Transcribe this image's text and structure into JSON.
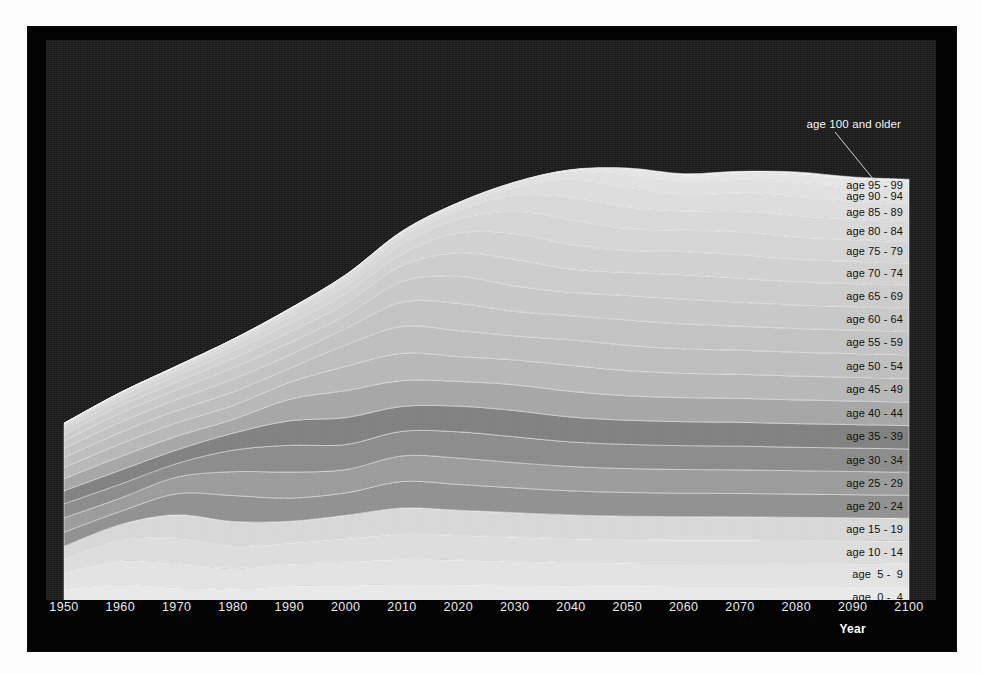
{
  "chart_data": {
    "type": "area",
    "title": "",
    "xlabel": "Year",
    "ylabel": "",
    "stacking": "stacked",
    "grid": false,
    "legend_position": "right-inline",
    "xlim": [
      1950,
      2100
    ],
    "x_ticks": [
      "1950",
      "1960",
      "1970",
      "1980",
      "1990",
      "2000",
      "2010",
      "2020",
      "2030",
      "2040",
      "2050",
      "2060",
      "2070",
      "2080",
      "2090",
      "2100"
    ],
    "x": [
      1950,
      1960,
      1970,
      1980,
      1990,
      2000,
      2010,
      2020,
      2030,
      2040,
      2050,
      2060,
      2070,
      2080,
      2090,
      2100
    ],
    "annotation": {
      "text": "age 100 and older",
      "points_to_series": "age 95 - 99"
    },
    "series": [
      {
        "name": "age  0 -  4",
        "color": "#e8e8e8",
        "values": [
          16.4,
          20.3,
          17.2,
          16.3,
          18.8,
          19.2,
          20.2,
          19.9,
          19.4,
          19.0,
          18.8,
          18.7,
          18.7,
          18.6,
          18.5,
          18.4
        ]
      },
      {
        "name": "age  5 -  9",
        "color": "#e2e2e2",
        "values": [
          13.2,
          18.7,
          19.9,
          16.8,
          18.0,
          19.3,
          20.4,
          20.1,
          19.6,
          19.1,
          18.9,
          18.8,
          18.8,
          18.7,
          18.6,
          18.5
        ]
      },
      {
        "name": "age 10 - 14",
        "color": "#dcdcdc",
        "values": [
          11.1,
          16.8,
          20.8,
          18.2,
          17.1,
          19.1,
          20.5,
          20.3,
          19.8,
          19.3,
          19.0,
          18.9,
          18.9,
          18.8,
          18.7,
          18.6
        ]
      },
      {
        "name": "age 15 - 19",
        "color": "#d7d7d7",
        "values": [
          10.6,
          13.2,
          19.1,
          20.3,
          17.8,
          19.0,
          21.5,
          20.5,
          20.0,
          19.5,
          19.2,
          19.1,
          19.0,
          18.9,
          18.8,
          18.7
        ]
      },
      {
        "name": "age 20 - 24",
        "color": "#8f8f8f",
        "values": [
          11.5,
          10.8,
          17.2,
          21.2,
          19.0,
          18.4,
          21.6,
          21.1,
          20.3,
          19.7,
          19.4,
          19.2,
          19.1,
          19.0,
          18.9,
          18.8
        ]
      },
      {
        "name": "age 25 - 29",
        "color": "#9a9a9a",
        "values": [
          11.7,
          10.9,
          13.6,
          19.5,
          21.3,
          19.0,
          21.0,
          21.6,
          20.6,
          19.9,
          19.6,
          19.4,
          19.3,
          19.1,
          19.0,
          18.9
        ]
      },
      {
        "name": "age 30 - 34",
        "color": "#8a8a8a",
        "values": [
          11.5,
          11.4,
          11.1,
          17.6,
          21.9,
          20.5,
          20.1,
          21.4,
          21.1,
          20.1,
          19.7,
          19.5,
          19.4,
          19.2,
          19.1,
          19.0
        ]
      },
      {
        "name": "age 35 - 39",
        "color": "#7f7f7f",
        "values": [
          10.7,
          11.4,
          11.2,
          13.9,
          20.0,
          22.0,
          20.4,
          21.0,
          21.5,
          20.4,
          19.8,
          19.6,
          19.5,
          19.3,
          19.2,
          19.1
        ]
      },
      {
        "name": "age 40 - 44",
        "color": "#a5a5a5",
        "values": [
          9.9,
          11.2,
          11.2,
          11.3,
          17.6,
          22.1,
          21.1,
          20.2,
          21.1,
          21.0,
          20.0,
          19.7,
          19.6,
          19.4,
          19.3,
          19.2
        ]
      },
      {
        "name": "age 45 - 49",
        "color": "#b6b6b6",
        "values": [
          9.1,
          10.3,
          10.9,
          11.3,
          13.9,
          19.9,
          22.3,
          20.4,
          20.3,
          21.3,
          20.5,
          19.8,
          19.7,
          19.5,
          19.4,
          19.3
        ]
      },
      {
        "name": "age 50 - 54",
        "color": "#bdbdbd",
        "values": [
          8.3,
          9.5,
          10.0,
          11.2,
          11.3,
          17.3,
          22.0,
          21.2,
          19.7,
          20.8,
          20.8,
          20.0,
          19.7,
          19.5,
          19.4,
          19.3
        ]
      },
      {
        "name": "age 55 - 59",
        "color": "#c2c2c2",
        "values": [
          7.4,
          8.4,
          9.1,
          10.4,
          11.0,
          13.5,
          19.8,
          22.3,
          20.0,
          19.8,
          20.7,
          20.3,
          19.6,
          19.4,
          19.3,
          19.2
        ]
      },
      {
        "name": "age 60 - 64",
        "color": "#c7c7c7",
        "values": [
          6.4,
          7.2,
          7.9,
          9.2,
          10.0,
          10.8,
          17.0,
          22.0,
          20.9,
          19.0,
          20.0,
          20.4,
          19.6,
          19.2,
          19.1,
          19.0
        ]
      },
      {
        "name": "age 65 - 69",
        "color": "#cbcbcb",
        "values": [
          5.2,
          6.0,
          6.6,
          7.7,
          8.7,
          9.8,
          12.9,
          19.3,
          21.7,
          19.1,
          18.8,
          19.9,
          19.6,
          18.9,
          18.8,
          18.7
        ]
      },
      {
        "name": "age 70 - 74",
        "color": "#d0d0d0",
        "values": [
          3.9,
          4.6,
          5.2,
          6.1,
          7.1,
          8.3,
          9.7,
          16.1,
          21.1,
          20.0,
          18.1,
          19.0,
          19.4,
          18.6,
          18.3,
          18.2
        ]
      },
      {
        "name": "age 75 - 79",
        "color": "#d4d4d4",
        "values": [
          2.6,
          3.2,
          3.7,
          4.5,
          5.4,
          6.5,
          7.7,
          11.4,
          18.2,
          20.4,
          17.9,
          17.5,
          18.6,
          18.2,
          17.6,
          17.5
        ]
      },
      {
        "name": "age 80 - 84",
        "color": "#d8d8d8",
        "values": [
          1.5,
          1.9,
          2.3,
          2.9,
          3.6,
          4.6,
          5.5,
          7.0,
          13.0,
          18.5,
          17.8,
          15.8,
          17.2,
          17.5,
          16.6,
          16.5
        ]
      },
      {
        "name": "age 85 - 89",
        "color": "#dcdcdc",
        "values": [
          0.7,
          0.9,
          1.2,
          1.5,
          2.0,
          2.6,
          3.3,
          4.0,
          7.0,
          13.8,
          15.9,
          13.3,
          14.6,
          15.6,
          14.7,
          14.6
        ]
      },
      {
        "name": "age 90 - 94",
        "color": "#e0e0e0",
        "values": [
          0.2,
          0.3,
          0.4,
          0.6,
          0.8,
          1.1,
          1.5,
          1.9,
          2.8,
          6.6,
          10.5,
          10.0,
          10.4,
          11.8,
          11.3,
          11.2
        ]
      },
      {
        "name": "age 95 - 99",
        "color": "#e4e4e4",
        "values": [
          0.0,
          0.1,
          0.1,
          0.1,
          0.2,
          0.3,
          0.4,
          0.6,
          0.9,
          1.8,
          4.4,
          5.3,
          5.3,
          6.2,
          6.4,
          6.3
        ]
      },
      {
        "name": "age 100 and older",
        "color": "#ececec",
        "values": [
          0.0,
          0.0,
          0.0,
          0.0,
          0.0,
          0.0,
          0.1,
          0.1,
          0.2,
          0.3,
          0.9,
          1.8,
          2.0,
          2.1,
          2.4,
          2.5
        ]
      }
    ]
  },
  "labels": {
    "annotation": "age 100 and older",
    "series_right": [
      "age 95 - 99",
      "age 90 - 94",
      "age 85 - 89",
      "age 80 - 84",
      "age 75 - 79",
      "age 70 - 74",
      "age 65 - 69",
      "age 60 - 64",
      "age 55 - 59",
      "age 50 - 54",
      "age 45 - 49",
      "age 40 - 44",
      "age 35 - 39",
      "age 30 - 34",
      "age 25 - 29",
      "age 20 - 24",
      "age 15 - 19",
      "age 10 - 14",
      "age  5 -  9",
      "age  0 -  4"
    ]
  },
  "axis": {
    "title": "Year",
    "ticks": [
      "1950",
      "1960",
      "1970",
      "1980",
      "1990",
      "2000",
      "2010",
      "2020",
      "2030",
      "2040",
      "2050",
      "2060",
      "2070",
      "2080",
      "2090",
      "2100"
    ]
  },
  "colors": {
    "page_background": "#fdfdfd",
    "frame": "#030303",
    "plot_background": "#1b1b1b",
    "tick_text": "#e9e9e9",
    "axis_title_text": "#ffffff",
    "series_label_text": "#111111",
    "annotation_text": "#f3f3f3"
  }
}
